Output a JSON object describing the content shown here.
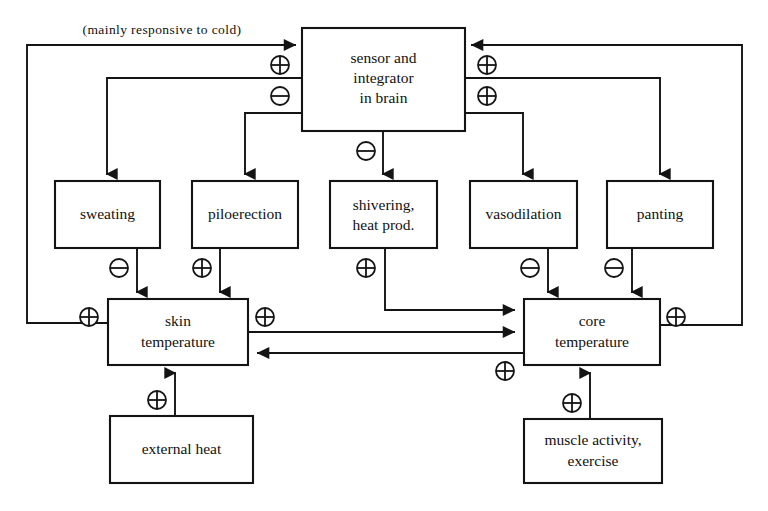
{
  "diagram": {
    "title_note": "(mainly responsive to cold)",
    "nodes": {
      "brain": {
        "line1": "sensor and",
        "line2": "integrator",
        "line3": "in brain"
      },
      "sweating": {
        "line1": "sweating"
      },
      "piloerection": {
        "line1": "piloerection"
      },
      "shivering": {
        "line1": "shivering,",
        "line2": "heat prod."
      },
      "vasodilation": {
        "line1": "vasodilation"
      },
      "panting": {
        "line1": "panting"
      },
      "skin_temperature": {
        "line1": "skin",
        "line2": "temperature"
      },
      "core_temperature": {
        "line1": "core",
        "line2": "temperature"
      },
      "external_heat": {
        "line1": "external heat"
      },
      "muscle_activity": {
        "line1": "muscle activity,",
        "line2": "exercise"
      }
    },
    "signs": {
      "skin_to_brain": "plus",
      "core_to_brain_upper": "plus",
      "brain_to_sweating_branch": "minus",
      "core_to_brain_lower": "plus",
      "brain_to_shivering": "minus",
      "sweating_to_skin": "minus",
      "piloerection_to_skin": "plus",
      "shivering_to_core": "plus",
      "vasodilation_to_core": "minus",
      "panting_to_core": "minus",
      "skin_left_input": "plus",
      "skin_right_output": "plus",
      "core_skin_feedback": "plus",
      "core_right_output": "plus",
      "external_heat_to_skin": "plus",
      "muscle_activity_to_core": "plus"
    },
    "colors": {
      "stroke": "#141414",
      "background": "#ffffff",
      "text": "#111111"
    }
  }
}
